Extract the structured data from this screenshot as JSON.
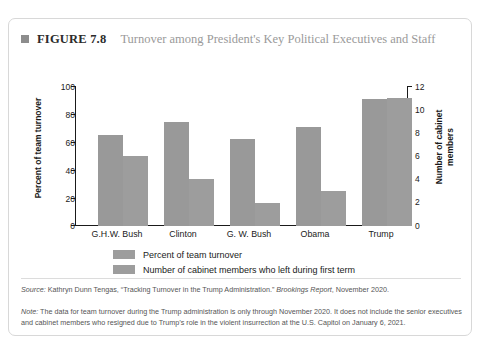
{
  "figure": {
    "bullet_icon": "square-bullet-icon",
    "number": "FIGURE 7.8",
    "title": "Turnover among President's Key Political Executives and Staff"
  },
  "chart_data": {
    "type": "bar",
    "title": "Turnover among President's Key Political Executives and Staff",
    "xlabel": "",
    "categories": [
      "G.H.W. Bush",
      "Clinton",
      "G. W. Bush",
      "Obama",
      "Trump"
    ],
    "series": [
      {
        "name": "Percent of team turnover",
        "axis": "left",
        "unit": "percent",
        "values": [
          65,
          74,
          62.5,
          71,
          91
        ],
        "color": "#999999"
      },
      {
        "name": "Number of cabinet members who left during first term",
        "axis": "right",
        "unit": "members",
        "values": [
          6,
          4,
          2,
          3,
          11
        ],
        "color": "#9d9d9d"
      }
    ],
    "y_left": {
      "label": "Percent of team turnover",
      "ticks": [
        0,
        20,
        40,
        60,
        80,
        100
      ],
      "ylim": [
        0,
        100
      ]
    },
    "y_right": {
      "label": "Number of cabinet\nmembers",
      "label_line1": "Number of cabinet",
      "label_line2": "members",
      "ticks": [
        0,
        2,
        4,
        6,
        8,
        10,
        12
      ],
      "ylim": [
        0,
        12
      ]
    },
    "grid": false,
    "legend_position": "bottom"
  },
  "legend": [
    {
      "label": "Percent of team turnover",
      "swatch_color": "#9d9d9d"
    },
    {
      "label": "Number of cabinet members who left during first term",
      "swatch_color": "#9d9d9d"
    }
  ],
  "footnotes": {
    "source_prefix": "Source:",
    "source_text": " Kathryn Dunn Tengas, “Tracking Turnover in the Trump Administration.” ",
    "source_publication": "Brookings Report",
    "source_suffix": ", November 2020.",
    "note_prefix": "Note:",
    "note_text": " The data for team turnover during the Trump administration is only through November 2020. It does not include the senior executives and cabinet members who resigned due to Trump’s role in the violent insurrection at the U.S. Capitol on January 6, 2021."
  }
}
